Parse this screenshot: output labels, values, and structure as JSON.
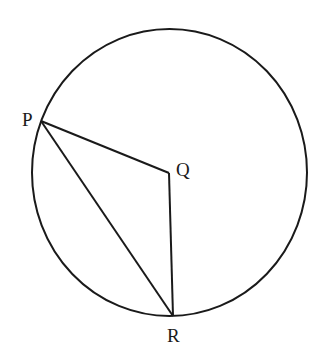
{
  "figure": {
    "background": "#ffffff",
    "stroke_color": "#1a1a1a",
    "circle": {
      "cx": 169.5,
      "cy": 172.5,
      "rx": 137.5,
      "ry": 143.5
    },
    "points": {
      "P": {
        "label": "P",
        "x": 41,
        "y": 121
      },
      "Q": {
        "label": "Q",
        "x": 169,
        "y": 173
      },
      "R": {
        "label": "R",
        "x": 173,
        "y": 316
      }
    },
    "segments": [
      {
        "from": "P",
        "to": "Q"
      },
      {
        "from": "Q",
        "to": "R"
      },
      {
        "from": "P",
        "to": "R"
      }
    ]
  }
}
